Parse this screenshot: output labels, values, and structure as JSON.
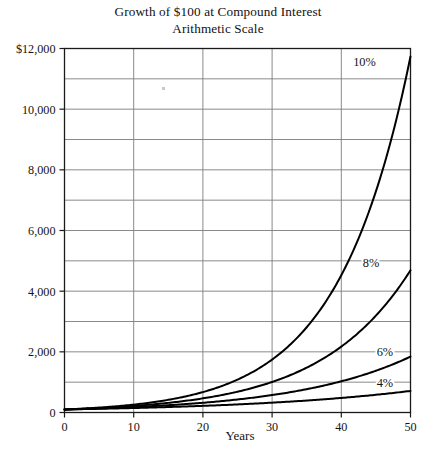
{
  "chart_data": {
    "type": "line",
    "title": "Growth of $100 at Compound Interest",
    "subtitle": "Arithmetic Scale",
    "xlabel": "Years",
    "ylabel": "",
    "xlim": [
      0,
      50
    ],
    "ylim": [
      0,
      12000
    ],
    "x_ticks": [
      0,
      10,
      20,
      30,
      40,
      50
    ],
    "x_tick_labels": [
      "0",
      "10",
      "20",
      "30",
      "40",
      "50"
    ],
    "y_ticks": [
      0,
      2000,
      4000,
      6000,
      8000,
      10000,
      12000
    ],
    "y_tick_labels": [
      "0",
      "2,000",
      "4,000",
      "6,000",
      "8,000",
      "10,000",
      "$12,000"
    ],
    "y_gridline_values": [
      0,
      1000,
      2000,
      3000,
      4000,
      5000,
      6000,
      7000,
      8000,
      9000,
      10000,
      11000,
      12000
    ],
    "grid": true,
    "legend_position": "inline-at-curve-ends",
    "principal": 100,
    "x": [
      0,
      5,
      10,
      15,
      20,
      25,
      30,
      35,
      40,
      45,
      50
    ],
    "series": [
      {
        "name": "4%",
        "label": "4%",
        "rate_percent": 4,
        "values": [
          100,
          122,
          148,
          180,
          219,
          267,
          324,
          395,
          480,
          584,
          711
        ],
        "label_x": 47.5,
        "label_y": 1000
      },
      {
        "name": "6%",
        "label": "6%",
        "rate_percent": 6,
        "values": [
          100,
          134,
          179,
          240,
          321,
          429,
          574,
          768,
          1029,
          1376,
          1842
        ],
        "label_x": 47.5,
        "label_y": 2000
      },
      {
        "name": "8%",
        "label": "8%",
        "rate_percent": 8,
        "values": [
          100,
          147,
          216,
          317,
          466,
          685,
          1006,
          1479,
          2172,
          3192,
          4690
        ],
        "label_x": 45.5,
        "label_y": 4950
      },
      {
        "name": "10%",
        "label": "10%",
        "rate_percent": 10,
        "values": [
          100,
          161,
          259,
          418,
          673,
          1083,
          1745,
          2810,
          4526,
          7289,
          11739
        ],
        "label_x": 45.0,
        "label_y": 11560
      }
    ],
    "colors": {
      "curve": "#000000",
      "grid": "#7d7d7d",
      "axis": "#1a1a1a",
      "background": "#ffffff",
      "text": "#141414"
    }
  }
}
